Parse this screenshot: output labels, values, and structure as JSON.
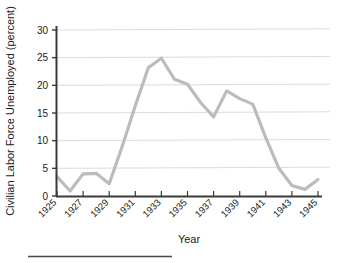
{
  "chart_data": {
    "type": "line",
    "title": "",
    "xlabel": "Year",
    "ylabel": "Civilian Labor Force Unemployed (percent)",
    "xlim": [
      1925,
      1945
    ],
    "ylim": [
      0,
      31
    ],
    "grid": true,
    "legend": "none",
    "line_color": "#bcbcbc",
    "axis_color": "#3a3a3a",
    "grid_color": "#dcdcdc",
    "x_tick_labels": [
      "1925",
      "1927",
      "1929",
      "1931",
      "1933",
      "1935",
      "1937",
      "1939",
      "1941",
      "1943",
      "1945"
    ],
    "x_tick_values": [
      1925,
      1927,
      1929,
      1931,
      1933,
      1935,
      1937,
      1939,
      1941,
      1943,
      1945
    ],
    "y_tick_labels": [
      "0",
      "5",
      "10",
      "15",
      "20",
      "25",
      "30"
    ],
    "y_tick_values": [
      0,
      5,
      10,
      15,
      20,
      25,
      30
    ],
    "x": [
      1925,
      1926,
      1927,
      1928,
      1929,
      1930,
      1931,
      1932,
      1933,
      1934,
      1935,
      1936,
      1937,
      1938,
      1939,
      1940,
      1941,
      1942,
      1943,
      1944,
      1945
    ],
    "values": [
      3.5,
      0.9,
      4.0,
      4.1,
      2.2,
      9.0,
      16.3,
      23.2,
      24.9,
      21.1,
      20.2,
      16.9,
      14.3,
      19.0,
      17.6,
      16.6,
      10.5,
      5.0,
      1.9,
      1.2,
      3.0
    ],
    "series": [
      {
        "name": "Civilian Labor Force Unemployed",
        "values": [
          3.5,
          0.9,
          4.0,
          4.1,
          2.2,
          9.0,
          16.3,
          23.2,
          24.9,
          21.1,
          20.2,
          16.9,
          14.3,
          19.0,
          17.6,
          16.6,
          10.5,
          5.0,
          1.9,
          1.2,
          3.0
        ]
      }
    ]
  },
  "footer": {
    "rule_present": true
  }
}
